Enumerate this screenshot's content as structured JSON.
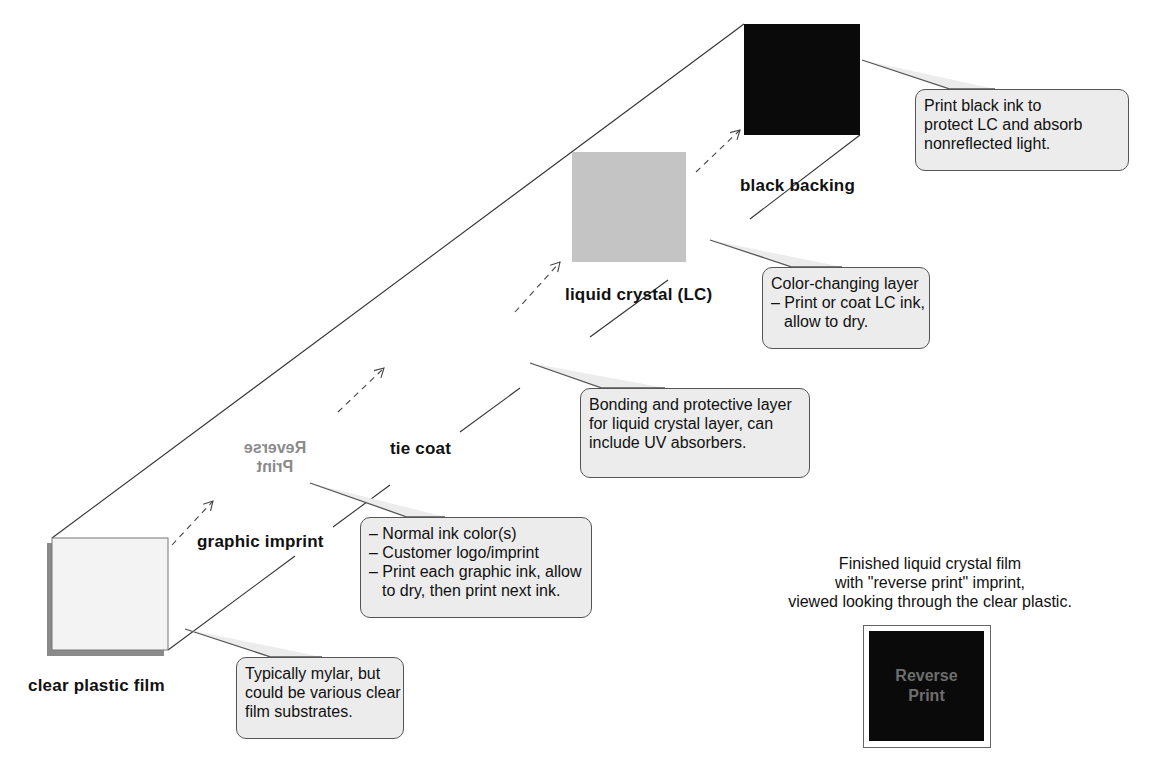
{
  "layers": [
    {
      "id": "clear",
      "label": "clear plastic film",
      "color": "#f2f2f2"
    },
    {
      "id": "graphic",
      "label": "graphic imprint",
      "imprint_text": [
        "Reverse",
        "Print"
      ],
      "imprint_color": "#8a8a8a"
    },
    {
      "id": "tie",
      "label": "tie coat"
    },
    {
      "id": "lc",
      "label": "liquid crystal (LC)",
      "color": "#c4c4c4"
    },
    {
      "id": "black",
      "label": "black backing",
      "color": "#0a0a0a"
    }
  ],
  "callouts": {
    "clear": [
      "Typically mylar, but",
      "could be various clear",
      "film substrates."
    ],
    "graphic": [
      "– Normal ink color(s)",
      "– Customer logo/imprint",
      "– Print each graphic ink, allow",
      "to dry, then print next ink."
    ],
    "tie": [
      "Bonding and protective layer",
      "for liquid crystal layer, can",
      "include UV absorbers."
    ],
    "lc": [
      "Color-changing layer",
      "– Print or coat LC ink,",
      "allow to dry."
    ],
    "black": [
      "Print black ink to",
      "protect LC and absorb",
      "nonreflected light."
    ]
  },
  "finished": {
    "caption": [
      "Finished liquid crystal film",
      "with \"reverse print\" imprint,",
      "viewed looking through the clear plastic."
    ],
    "sample_text": [
      "Reverse",
      "Print"
    ],
    "sample_bg": "#0a0a0a",
    "sample_text_color": "#6e6e6e"
  }
}
